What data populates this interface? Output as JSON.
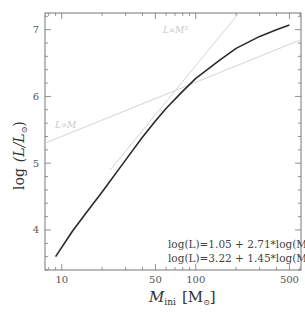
{
  "chart_data": {
    "type": "line",
    "title": "",
    "xlabel": "M_ini [M_sun]",
    "ylabel": "log (L/L_sun)",
    "xscale": "log",
    "xlim": [
      7.5,
      610
    ],
    "ylim": [
      3.4,
      7.25
    ],
    "xticks": [
      10,
      50,
      100,
      500
    ],
    "xtick_labels": [
      "10",
      "50",
      "100",
      "500"
    ],
    "yticks": [
      4,
      5,
      6,
      7
    ],
    "ytick_labels": [
      "4",
      "5",
      "6",
      "7"
    ],
    "grid": false,
    "series": [
      {
        "name": "mass-luminosity relation",
        "style": "solid-dark",
        "x": [
          9,
          12,
          15,
          20,
          30,
          40,
          50,
          60,
          80,
          100,
          150,
          200,
          300,
          400,
          500
        ],
        "y": [
          3.6,
          3.98,
          4.24,
          4.57,
          5.05,
          5.39,
          5.63,
          5.82,
          6.08,
          6.27,
          6.54,
          6.72,
          6.9,
          7.0,
          7.07
        ]
      },
      {
        "name": "L~M",
        "style": "faint-guide",
        "x": [
          7.5,
          610
        ],
        "y": [
          5.3,
          6.85
        ]
      },
      {
        "name": "L~M^3",
        "style": "faint-guide",
        "x": [
          23,
          210
        ],
        "y": [
          4.9,
          7.25
        ]
      }
    ],
    "annotations": [
      {
        "text": "L~M",
        "x": 9,
        "y": 5.75
      },
      {
        "text": "L~M³",
        "x": 115,
        "y": 7.0
      },
      {
        "text": "log(L)=1.05 + 2.71*log(M<50)"
      },
      {
        "text": "log(L)=3.22 + 1.45*log(M>80)"
      }
    ]
  },
  "labels": {
    "ylabel_main": "log",
    "ylabel_frac": "(L/L",
    "ylabel_sun": "⊙",
    "ylabel_close": ")",
    "xlabel_main": "M",
    "xlabel_sub": "ini",
    "xlabel_unit_open": "[M",
    "xlabel_unit_sun": "⊙",
    "xlabel_unit_close": "]",
    "guide_linear": "L∝M",
    "guide_cubic": "L∝M³",
    "fit1_prefix": "log(L)=1.05 + 2.71*log(M",
    "fit1_sub": "<50",
    "fit1_suffix": ")",
    "fit2_prefix": "log(L)=3.22 + 1.45*log(M",
    "fit2_sub": ">80",
    "fit2_suffix": ")"
  },
  "colors": {
    "curve": "#2a2a2a",
    "guide": "#d4d4d4",
    "axis": "#777777",
    "text": "#444444"
  }
}
